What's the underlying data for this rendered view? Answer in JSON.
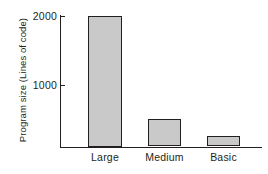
{
  "chart_data": {
    "type": "bar",
    "title": "",
    "subtitle": "",
    "xlabel": "",
    "ylabel": "Program size (Lines of code)",
    "categories": [
      "Large",
      "Medium",
      "Basic"
    ],
    "values": [
      2000,
      420,
      160
    ],
    "series": [
      {
        "name": "Program size",
        "values": [
          2000,
          420,
          160
        ]
      }
    ],
    "yticks": [
      1000,
      2000
    ],
    "ytick_labels": [
      "1000",
      "2000"
    ],
    "ylim": [
      0,
      2000
    ],
    "grid": false,
    "legend": false,
    "legend_position": "none",
    "bar_fill_color": "#c9c9c9",
    "bar_edge_color": "#231f20",
    "axis_color": "#231f20",
    "background_color": "#ffffff"
  }
}
